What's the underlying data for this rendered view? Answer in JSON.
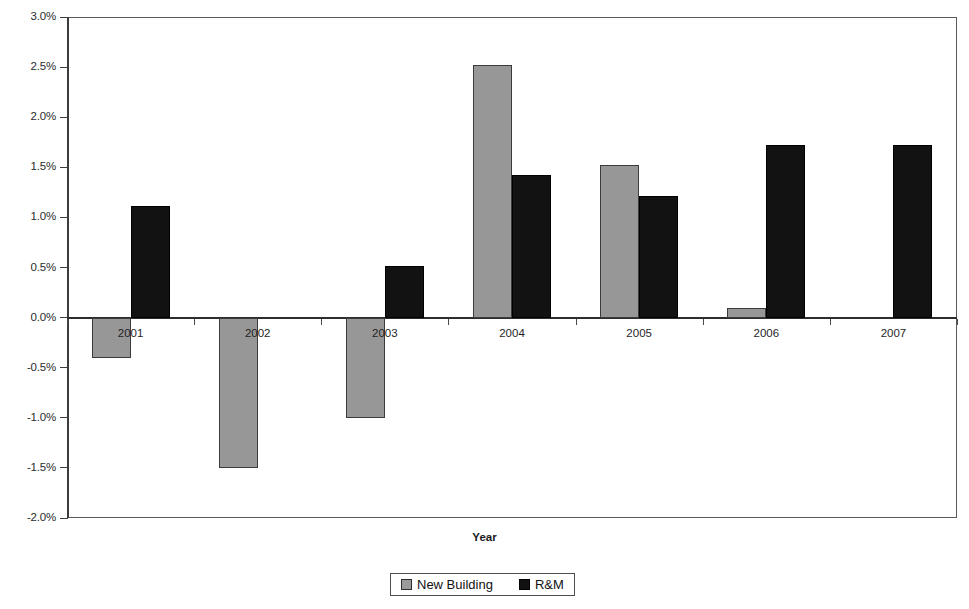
{
  "chart_data": {
    "type": "bar",
    "title": "",
    "xlabel": "Year",
    "ylabel": "",
    "categories": [
      "2001",
      "2002",
      "2003",
      "2004",
      "2005",
      "2006",
      "2007"
    ],
    "series": [
      {
        "name": "New Building",
        "color": "#979797",
        "values": [
          -0.4,
          -1.5,
          -1.0,
          2.52,
          1.52,
          0.1,
          0.0
        ]
      },
      {
        "name": "R&M",
        "color": "#121212",
        "values": [
          1.11,
          0.0,
          0.51,
          1.42,
          1.21,
          1.72,
          1.72
        ]
      }
    ],
    "ylim": [
      -2.0,
      3.0
    ],
    "ytick_values": [
      3.0,
      2.5,
      2.0,
      1.5,
      1.0,
      0.5,
      0.0,
      -0.5,
      -1.0,
      -1.5,
      -2.0
    ],
    "ytick_labels": [
      "3.0%",
      "2.5%",
      "2.0%",
      "1.5%",
      "1.0%",
      "0.5%",
      "0.0%",
      "-0.5%",
      "-1.0%",
      "-1.5%",
      "-2.0%"
    ],
    "grid": false,
    "legend_position": "bottom",
    "legend_entries": [
      "New Building",
      "R&M"
    ],
    "value_unit": "percent",
    "zero_baseline": 0.0
  }
}
